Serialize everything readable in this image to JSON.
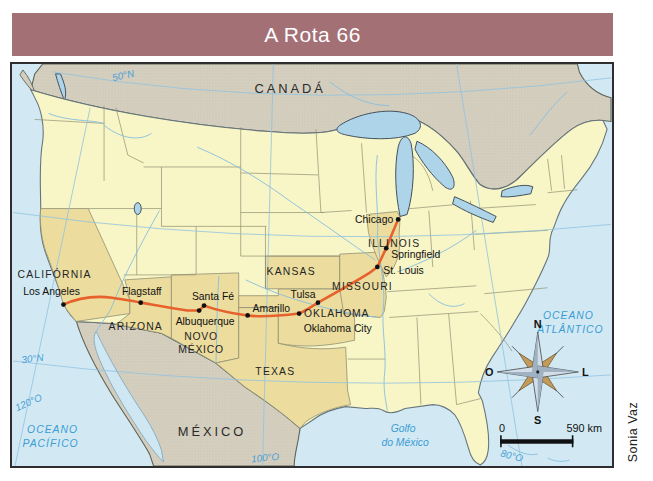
{
  "title_bar": {
    "label": "A Rota 66"
  },
  "credit": "Sonia Vaz",
  "map": {
    "countries": {
      "canada": "CANADÁ",
      "mexico": "MÉXICO"
    },
    "oceans": {
      "pacific_line1": "OCEANO",
      "pacific_line2": "PACÍFICO",
      "atlantic_line1": "OCEANO",
      "atlantic_line2": "ATLÂNTICO",
      "gulf_line1": "Golfo",
      "gulf_line2": "do México"
    },
    "graticules": {
      "lat50": "50°N",
      "lat30": "30°N",
      "lon120": "120°O",
      "lon100": "100°O",
      "lon80": "80°O"
    },
    "states": {
      "california": "CALIFÓRNIA",
      "arizona": "ARIZONA",
      "novo_mexico_line1": "NOVO",
      "novo_mexico_line2": "MÉXICO",
      "texas": "TEXAS",
      "oklahoma": "OKLAHOMA",
      "kansas": "KANSAS",
      "missouri": "MISSOURI",
      "illinois": "ILLINOIS"
    },
    "cities": {
      "los_angeles": "Los Angeles",
      "flagstaff": "Flagstaff",
      "albuquerque": "Albuquerque",
      "santa_fe": "Santa Fé",
      "amarillo": "Amarillo",
      "oklahoma_city": "Oklahoma City",
      "tulsa": "Tulsa",
      "st_louis": "St. Louis",
      "springfield": "Springfield",
      "chicago": "Chicago"
    },
    "route_order": [
      "Chicago",
      "Springfield",
      "St. Louis",
      "Tulsa",
      "Oklahoma City",
      "Amarillo",
      "Santa Fé",
      "Albuquerque",
      "Flagstaff",
      "Los Angeles"
    ],
    "compass": {
      "north": "N",
      "south": "S",
      "west": "O",
      "east": "L"
    },
    "scale": {
      "start": "0",
      "end": "590 km"
    },
    "colors": {
      "title_bg": "#a37075",
      "route": "#e7612c",
      "ocean": "#d2e9f3",
      "state_default": "#f8f5c6",
      "state_route": "#ecdc9e",
      "foreign_land": "#d5cfc0",
      "water_text": "#3b9cd4"
    }
  }
}
